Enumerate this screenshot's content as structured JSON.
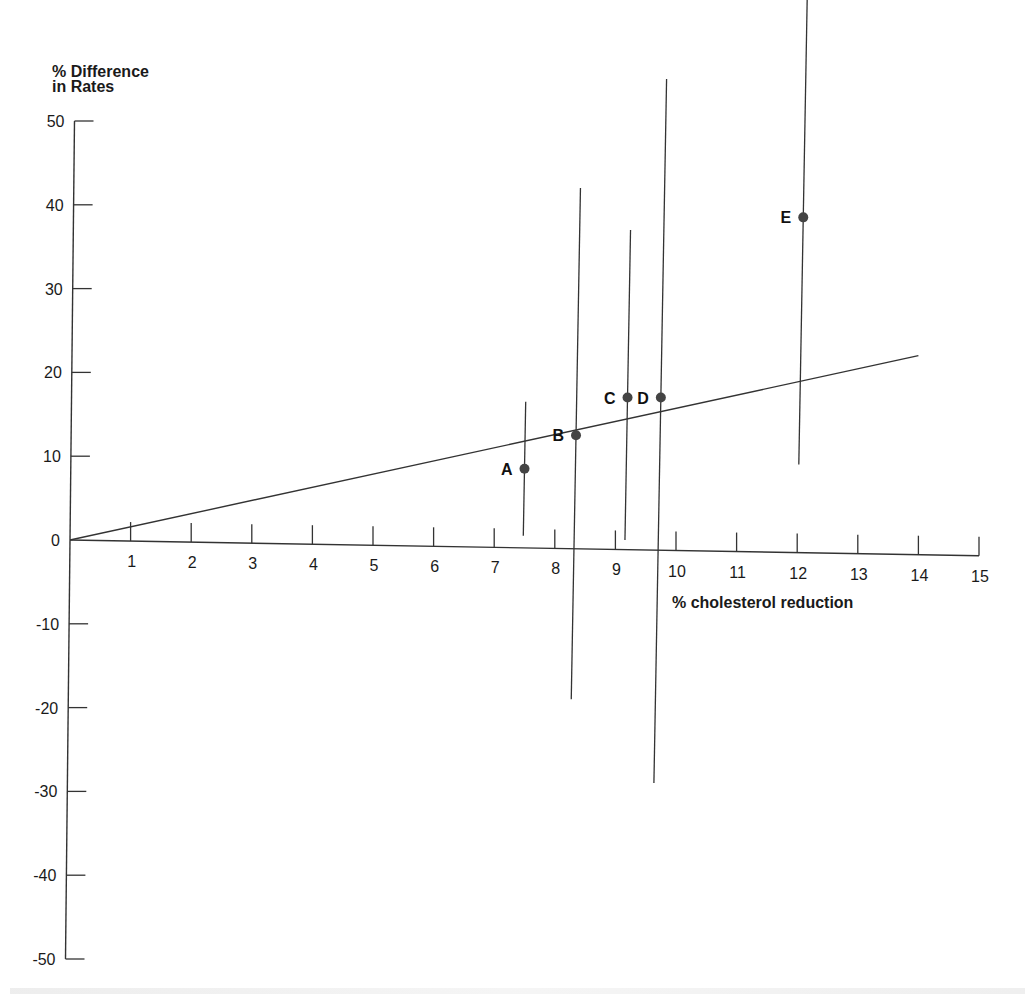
{
  "chart_data": {
    "type": "scatter",
    "title": "",
    "ylabel": "% Difference in Rates",
    "ylabel_lines": [
      "% Difference",
      "in Rates"
    ],
    "xlabel": "% cholesterol reduction",
    "xlim": [
      0,
      15
    ],
    "ylim": [
      -50,
      50
    ],
    "x_ticks": [
      1,
      2,
      3,
      4,
      5,
      6,
      7,
      8,
      9,
      10,
      11,
      12,
      13,
      14,
      15
    ],
    "y_ticks": [
      50,
      40,
      30,
      20,
      10,
      0,
      -10,
      -20,
      -30,
      -40,
      -50
    ],
    "y_tick_labels": [
      "50",
      "40",
      "30",
      "20",
      "10",
      "0",
      "-10",
      "-20",
      "-30",
      "-40",
      "-50"
    ],
    "grid": false,
    "legend": null,
    "points": [
      {
        "label": "A",
        "x": 7.5,
        "y": 8.5,
        "ci_low": 0.5,
        "ci_high": 16.5
      },
      {
        "label": "B",
        "x": 8.35,
        "y": 12.5,
        "ci_low": -19,
        "ci_high": 42
      },
      {
        "label": "C",
        "x": 9.2,
        "y": 17,
        "ci_low": 0,
        "ci_high": 37
      },
      {
        "label": "D",
        "x": 9.75,
        "y": 17,
        "ci_low": -29,
        "ci_high": 55
      },
      {
        "label": "E",
        "x": 12.1,
        "y": 38.5,
        "ci_low": 9,
        "ci_high": 65
      }
    ],
    "regression_line": {
      "x0": 0,
      "y0": 0,
      "x1": 14,
      "y1": 22
    },
    "colors": {
      "axis": "#333333",
      "point": "#444444",
      "line": "#333333"
    }
  }
}
